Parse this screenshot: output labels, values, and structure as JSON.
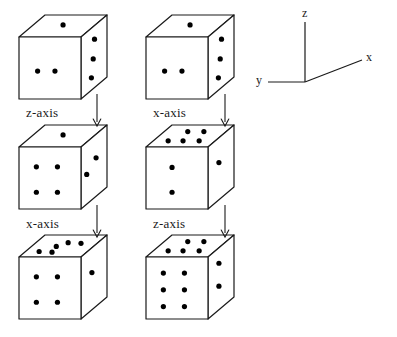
{
  "figure": {
    "background_color": "#ffffff",
    "stroke_color": "#1a1a1a",
    "pip_color": "#000000",
    "width": 397,
    "height": 337
  },
  "axes_gizmo": {
    "name": "coordinate-axes",
    "z_label": "z",
    "x_label": "x",
    "y_label": "y",
    "origin": {
      "x": 305,
      "y": 82
    },
    "z_tip": {
      "x": 305,
      "y": 22
    },
    "x_tip": {
      "x": 362,
      "y": 60
    },
    "y_tip": {
      "x": 268,
      "y": 82
    }
  },
  "columns": [
    {
      "name": "left-sequence",
      "steps": [
        {
          "label": "z-axis"
        },
        {
          "label": "x-axis"
        }
      ]
    },
    {
      "name": "right-sequence",
      "steps": [
        {
          "label": "x-axis"
        },
        {
          "label": "z-axis"
        }
      ]
    }
  ],
  "dice": [
    {
      "id": "die-row1-col1",
      "row": 1,
      "column": 1,
      "position": {
        "x": 18,
        "y": 14
      },
      "front_face_pips": 2,
      "top_face_pips": 1,
      "right_face_pips": 3,
      "front_pip_positions": [
        [
          0.3,
          0.55
        ],
        [
          0.58,
          0.55
        ]
      ],
      "top_pip_positions": [
        [
          0.48,
          0.45
        ]
      ],
      "right_pip_positions": [
        [
          0.52,
          0.22
        ],
        [
          0.47,
          0.52
        ],
        [
          0.4,
          0.8
        ]
      ]
    },
    {
      "id": "die-row1-col2",
      "row": 1,
      "column": 2,
      "position": {
        "x": 145,
        "y": 14
      },
      "front_face_pips": 2,
      "top_face_pips": 1,
      "right_face_pips": 3,
      "front_pip_positions": [
        [
          0.3,
          0.55
        ],
        [
          0.58,
          0.55
        ]
      ],
      "top_pip_positions": [
        [
          0.48,
          0.45
        ]
      ],
      "right_pip_positions": [
        [
          0.52,
          0.22
        ],
        [
          0.47,
          0.52
        ],
        [
          0.4,
          0.8
        ]
      ]
    },
    {
      "id": "die-row2-col1",
      "row": 2,
      "column": 1,
      "position": {
        "x": 18,
        "y": 124
      },
      "front_face_pips": 4,
      "top_face_pips": 1,
      "right_face_pips": 2,
      "front_pip_positions": [
        [
          0.28,
          0.32
        ],
        [
          0.62,
          0.32
        ],
        [
          0.28,
          0.73
        ],
        [
          0.62,
          0.73
        ]
      ],
      "top_pip_positions": [
        [
          0.48,
          0.45
        ]
      ],
      "right_pip_positions": [
        [
          0.22,
          0.52
        ],
        [
          0.58,
          0.38
        ]
      ]
    },
    {
      "id": "die-row2-col2",
      "row": 2,
      "column": 2,
      "position": {
        "x": 145,
        "y": 124
      },
      "front_face_pips": 2,
      "top_face_pips": 5,
      "right_face_pips": 1,
      "front_pip_positions": [
        [
          0.42,
          0.33
        ],
        [
          0.42,
          0.73
        ]
      ],
      "top_pip_positions": [
        [
          0.24,
          0.72
        ],
        [
          0.48,
          0.72
        ],
        [
          0.38,
          0.3
        ],
        [
          0.64,
          0.3
        ],
        [
          0.74,
          0.72
        ]
      ],
      "right_pip_positions": [
        [
          0.42,
          0.4
        ]
      ]
    },
    {
      "id": "die-row3-col1",
      "row": 3,
      "column": 1,
      "position": {
        "x": 18,
        "y": 234
      },
      "front_face_pips": 4,
      "top_face_pips": 5,
      "right_face_pips": 1,
      "front_pip_positions": [
        [
          0.28,
          0.32
        ],
        [
          0.62,
          0.32
        ],
        [
          0.28,
          0.73
        ],
        [
          0.62,
          0.73
        ]
      ],
      "top_pip_positions": [
        [
          0.22,
          0.75
        ],
        [
          0.44,
          0.78
        ],
        [
          0.4,
          0.52
        ],
        [
          0.52,
          0.35
        ],
        [
          0.74,
          0.38
        ]
      ],
      "right_pip_positions": [
        [
          0.42,
          0.4
        ]
      ]
    },
    {
      "id": "die-row3-col2",
      "row": 3,
      "column": 2,
      "position": {
        "x": 145,
        "y": 234
      },
      "front_face_pips": 6,
      "top_face_pips": 5,
      "right_face_pips": 2,
      "front_pip_positions": [
        [
          0.28,
          0.26
        ],
        [
          0.62,
          0.26
        ],
        [
          0.28,
          0.53
        ],
        [
          0.62,
          0.53
        ],
        [
          0.28,
          0.8
        ],
        [
          0.62,
          0.8
        ]
      ],
      "top_pip_positions": [
        [
          0.24,
          0.72
        ],
        [
          0.48,
          0.72
        ],
        [
          0.38,
          0.3
        ],
        [
          0.64,
          0.3
        ],
        [
          0.74,
          0.72
        ]
      ],
      "right_pip_positions": [
        [
          0.42,
          0.25
        ],
        [
          0.42,
          0.62
        ]
      ]
    }
  ],
  "step_labels": [
    {
      "id": "label-row1-col1",
      "text": "z-axis",
      "x": 26,
      "y": 105
    },
    {
      "id": "label-row1-col2",
      "text": "x-axis",
      "x": 153,
      "y": 105
    },
    {
      "id": "label-row2-col1",
      "text": "x-axis",
      "x": 26,
      "y": 216
    },
    {
      "id": "label-row2-col2",
      "text": "z-axis",
      "x": 153,
      "y": 216
    }
  ],
  "arrows": [
    {
      "id": "arrow-col1-step1",
      "x": 91,
      "y": 94,
      "length": 32
    },
    {
      "id": "arrow-col2-step1",
      "x": 219,
      "y": 94,
      "length": 32
    },
    {
      "id": "arrow-col1-step2",
      "x": 91,
      "y": 205,
      "length": 32
    },
    {
      "id": "arrow-col2-step2",
      "x": 219,
      "y": 205,
      "length": 32
    }
  ]
}
